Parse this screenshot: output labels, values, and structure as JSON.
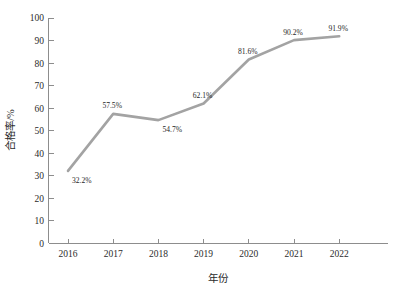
{
  "chart_data": {
    "type": "line",
    "title": "",
    "subtitle": "",
    "xlabel": "年份",
    "ylabel": "合格率/%",
    "categories": [
      "2016",
      "2017",
      "2018",
      "2019",
      "2020",
      "2021",
      "2022"
    ],
    "values": [
      32.2,
      57.5,
      54.7,
      62.1,
      81.6,
      90.2,
      91.9
    ],
    "point_labels": [
      "32.2%",
      "57.5%",
      "54.7%",
      "62.1%",
      "81.6%",
      "90.2%",
      "91.9%"
    ],
    "series": [
      {
        "name": "合格率",
        "values": [
          32.2,
          57.5,
          54.7,
          62.1,
          81.6,
          90.2,
          91.9
        ],
        "color": "#a3a3a3"
      }
    ],
    "ylim": [
      0,
      100
    ],
    "ytick_labels": [
      "0",
      "10",
      "20",
      "30",
      "40",
      "50",
      "60",
      "70",
      "80",
      "90",
      "100"
    ],
    "ytick_values": [
      0,
      10,
      20,
      30,
      40,
      50,
      60,
      70,
      80,
      90,
      100
    ],
    "xtick_labels": [
      "2016",
      "2017",
      "2018",
      "2019",
      "2020",
      "2021",
      "2022"
    ],
    "grid": false,
    "legend": false,
    "legend_position": "none",
    "label_placement": [
      "below-right",
      "above-left",
      "below-right",
      "above-left",
      "above-left",
      "above-left",
      "above-left"
    ],
    "colors": {
      "line": "#a3a3a3",
      "axis": "#8d8d8d",
      "text": "#1f1f1f",
      "background": "#ffffff"
    }
  }
}
